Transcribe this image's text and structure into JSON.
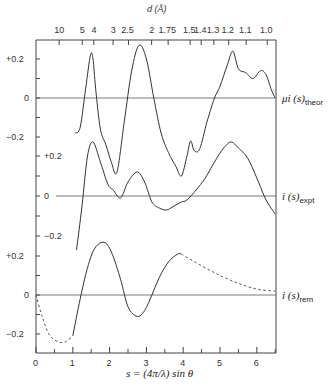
{
  "chart_data": {
    "type": "line",
    "title": "",
    "top_axis": {
      "label": "d (Å)",
      "tick_labels": [
        "10",
        "5",
        "4",
        "3",
        "2.5",
        "2",
        "1.75",
        "1.5",
        "1.4",
        "1.3",
        "1.2",
        "1.1",
        "1.0"
      ]
    },
    "xlabel": "s = (4π/λ) sin θ",
    "x_ticks": [
      "0",
      "1",
      "2",
      "3",
      "4",
      "5",
      "6"
    ],
    "xlim": [
      0,
      6.5
    ],
    "series": [
      {
        "name": "μi(s)theor",
        "label_main": "μi (s)",
        "label_sub": "theor",
        "y_ticks": [
          "+0.2",
          "0",
          "−0.2"
        ],
        "points": [
          [
            1.06,
            -0.18
          ],
          [
            1.2,
            -0.15
          ],
          [
            1.35,
            0.05
          ],
          [
            1.48,
            0.22
          ],
          [
            1.55,
            0.2
          ],
          [
            1.62,
            0.05
          ],
          [
            1.75,
            -0.16
          ],
          [
            1.9,
            -0.24
          ],
          [
            2.05,
            -0.33
          ],
          [
            2.2,
            -0.38
          ],
          [
            2.4,
            -0.12
          ],
          [
            2.6,
            0.14
          ],
          [
            2.8,
            0.27
          ],
          [
            3.0,
            0.2
          ],
          [
            3.2,
            0.0
          ],
          [
            3.4,
            -0.18
          ],
          [
            3.6,
            -0.28
          ],
          [
            3.8,
            -0.35
          ],
          [
            3.95,
            -0.4
          ],
          [
            4.1,
            -0.3
          ],
          [
            4.2,
            -0.22
          ],
          [
            4.3,
            -0.27
          ],
          [
            4.45,
            -0.26
          ],
          [
            4.65,
            -0.12
          ],
          [
            4.85,
            0.0
          ],
          [
            5.0,
            0.06
          ],
          [
            5.2,
            0.17
          ],
          [
            5.35,
            0.24
          ],
          [
            5.5,
            0.15
          ],
          [
            5.7,
            0.13
          ],
          [
            5.9,
            0.1
          ],
          [
            6.1,
            0.14
          ],
          [
            6.25,
            0.12
          ],
          [
            6.4,
            0.04
          ],
          [
            6.5,
            0.0
          ]
        ]
      },
      {
        "name": "i(s)expt",
        "label_main": "i (s)",
        "label_sub": "expt",
        "y_ticks": [
          "+0.2",
          "0",
          "−0.2"
        ],
        "points": [
          [
            1.1,
            -0.27
          ],
          [
            1.25,
            -0.05
          ],
          [
            1.4,
            0.2
          ],
          [
            1.55,
            0.27
          ],
          [
            1.75,
            0.17
          ],
          [
            1.95,
            0.06
          ],
          [
            2.1,
            0.03
          ],
          [
            2.3,
            -0.01
          ],
          [
            2.5,
            0.07
          ],
          [
            2.75,
            0.12
          ],
          [
            2.95,
            0.07
          ],
          [
            3.15,
            -0.03
          ],
          [
            3.35,
            -0.06
          ],
          [
            3.55,
            -0.07
          ],
          [
            3.75,
            -0.05
          ],
          [
            3.95,
            -0.03
          ],
          [
            4.1,
            -0.02
          ],
          [
            4.35,
            0.03
          ],
          [
            4.6,
            0.09
          ],
          [
            4.85,
            0.17
          ],
          [
            5.1,
            0.24
          ],
          [
            5.3,
            0.27
          ],
          [
            5.5,
            0.24
          ],
          [
            5.75,
            0.19
          ],
          [
            6.0,
            0.09
          ],
          [
            6.2,
            0.0
          ],
          [
            6.35,
            -0.05
          ],
          [
            6.5,
            -0.09
          ]
        ]
      },
      {
        "name": "i(s)rem",
        "label_main": "i (s)",
        "label_sub": "rem",
        "y_ticks": [
          "+0.2",
          "0",
          "−0.2"
        ],
        "solid_points": [
          [
            1.0,
            -0.21
          ],
          [
            1.2,
            -0.02
          ],
          [
            1.4,
            0.14
          ],
          [
            1.6,
            0.24
          ],
          [
            1.85,
            0.27
          ],
          [
            2.05,
            0.22
          ],
          [
            2.3,
            0.08
          ],
          [
            2.5,
            -0.06
          ],
          [
            2.75,
            -0.11
          ],
          [
            2.95,
            -0.08
          ],
          [
            3.15,
            0.0
          ],
          [
            3.35,
            0.09
          ],
          [
            3.6,
            0.17
          ],
          [
            3.85,
            0.21
          ],
          [
            3.95,
            0.21
          ]
        ],
        "dashed_points_left": [
          [
            0,
            0.0
          ],
          [
            0.15,
            -0.1
          ],
          [
            0.35,
            -0.2
          ],
          [
            0.6,
            -0.24
          ],
          [
            0.8,
            -0.24
          ],
          [
            1.0,
            -0.21
          ]
        ],
        "dashed_points_right": [
          [
            3.95,
            0.21
          ],
          [
            4.5,
            0.15
          ],
          [
            5.0,
            0.1
          ],
          [
            5.5,
            0.06
          ],
          [
            6.0,
            0.03
          ],
          [
            6.5,
            0.02
          ]
        ]
      }
    ],
    "grid": false,
    "legend": "labels at right end of each curve"
  }
}
